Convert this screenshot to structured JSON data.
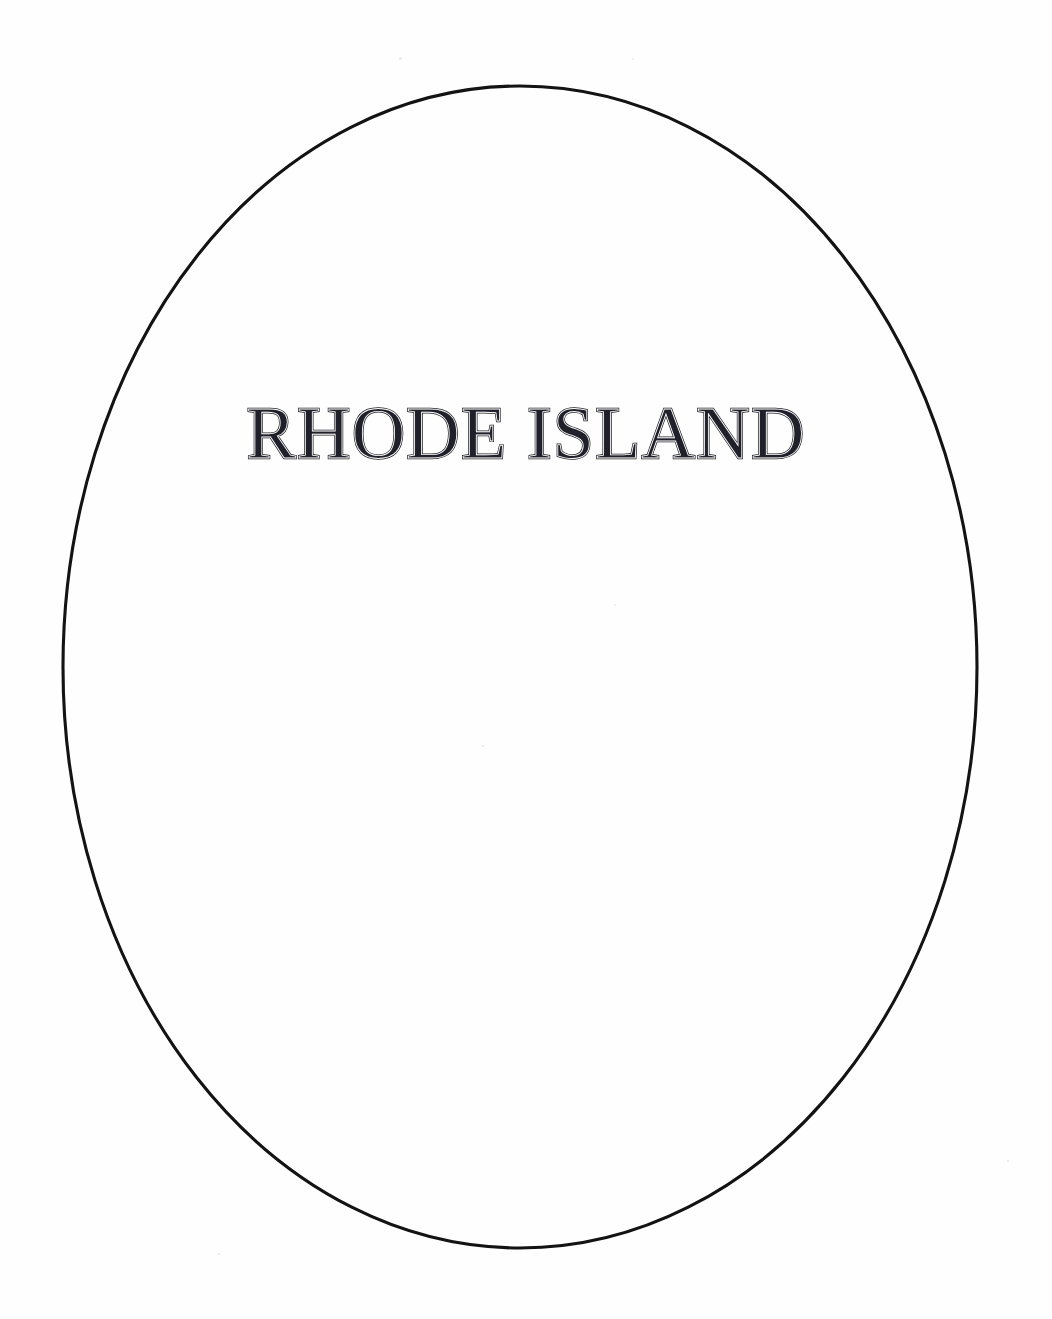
{
  "page": {
    "background_color": "#fefefe",
    "ink_color": "#131313",
    "width": 1052,
    "height": 1319,
    "document_type": "scanned-book-title-page"
  },
  "border": {
    "shape_name": "oval-frame",
    "stroke_color": "#131313",
    "stroke_width": 3,
    "center_x": 520,
    "center_y": 667,
    "radius_x": 457,
    "radius_y": 581
  },
  "title": {
    "text": "RHODE ISLAND",
    "words": [
      "RHODE",
      "ISLAND"
    ],
    "style": "engraved-inline-serif",
    "color": "#20202a",
    "cap_height_px": 54,
    "left_px": 222,
    "right_px": 823,
    "baseline_y_px": 458
  },
  "specks": [
    {
      "x": 399,
      "y": 57,
      "size": 3
    },
    {
      "x": 632,
      "y": 58,
      "size": 2
    },
    {
      "x": 482,
      "y": 745,
      "size": 2
    },
    {
      "x": 614,
      "y": 604,
      "size": 2
    },
    {
      "x": 218,
      "y": 1253,
      "size": 2
    },
    {
      "x": 1007,
      "y": 1160,
      "size": 2
    }
  ]
}
